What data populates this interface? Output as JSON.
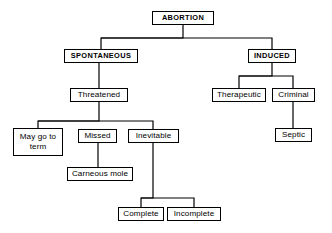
{
  "diagram": {
    "style": {
      "background": "#ffffff",
      "line_color": "#000000",
      "box_border": "#000000",
      "text_color": "#000000"
    },
    "nodes": [
      {
        "id": "abortion",
        "label": "ABORTION",
        "style": "caps",
        "x": 152,
        "y": 11,
        "w": 62,
        "h": 14
      },
      {
        "id": "spontaneous",
        "label": "SPONTANEOUS",
        "style": "caps",
        "x": 64,
        "y": 49,
        "w": 74,
        "h": 14
      },
      {
        "id": "induced",
        "label": "INDUCED",
        "style": "caps",
        "x": 248,
        "y": 49,
        "w": 48,
        "h": 14
      },
      {
        "id": "threatened",
        "label": "Threatened",
        "style": "plain",
        "x": 70,
        "y": 88,
        "w": 58,
        "h": 14
      },
      {
        "id": "therapeutic",
        "label": "Therapeutic",
        "style": "plain",
        "x": 212,
        "y": 88,
        "w": 54,
        "h": 14
      },
      {
        "id": "criminal",
        "label": "Criminal",
        "style": "plain",
        "x": 272,
        "y": 88,
        "w": 43,
        "h": 14
      },
      {
        "id": "may-go-term",
        "label": "May go to\nterm",
        "style": "multi",
        "x": 13,
        "y": 128,
        "w": 50,
        "h": 28
      },
      {
        "id": "missed",
        "label": "Missed",
        "style": "plain",
        "x": 78,
        "y": 129,
        "w": 39,
        "h": 14
      },
      {
        "id": "inevitable",
        "label": "Inevitable",
        "style": "plain",
        "x": 128,
        "y": 129,
        "w": 51,
        "h": 14
      },
      {
        "id": "septic",
        "label": "Septic",
        "style": "plain",
        "x": 275,
        "y": 128,
        "w": 37,
        "h": 14
      },
      {
        "id": "carneous",
        "label": "Carneous mole",
        "style": "plain",
        "x": 67,
        "y": 167,
        "w": 66,
        "h": 14
      },
      {
        "id": "complete",
        "label": "Complete",
        "style": "plain",
        "x": 118,
        "y": 207,
        "w": 46,
        "h": 14
      },
      {
        "id": "incomplete",
        "label": "Incomplete",
        "style": "plain",
        "x": 167,
        "y": 207,
        "w": 54,
        "h": 14
      }
    ],
    "edges": [
      {
        "id": "abortion-bus",
        "from": "abortion",
        "to": "spontaneous-induced-bus",
        "points": "183,25 183,38 101,38 101,49"
      },
      {
        "id": "abortion-to-induced",
        "from": "abortion",
        "to": "induced",
        "points": "101,38 272,38 272,49"
      },
      {
        "id": "spontaneous-threatened",
        "from": "spontaneous",
        "to": "threatened",
        "points": "99,63 99,88"
      },
      {
        "id": "induced-bus",
        "from": "induced",
        "to": "therapeutic",
        "points": "272,63 272,76 239,76 239,88"
      },
      {
        "id": "induced-to-criminal",
        "from": "induced",
        "to": "criminal",
        "points": "239,76 293,76 293,88"
      },
      {
        "id": "criminal-septic",
        "from": "criminal",
        "to": "septic",
        "points": "293,102 293,128"
      },
      {
        "id": "threatened-bus-left",
        "from": "threatened",
        "to": "may-go-term",
        "points": "99,102 99,121 38,121 38,128"
      },
      {
        "id": "threatened-to-missed",
        "from": "threatened",
        "to": "missed",
        "points": "38,121 153,121 153,129"
      },
      {
        "id": "missed-carneous",
        "from": "missed",
        "to": "carneous",
        "points": "98,143 98,167"
      },
      {
        "id": "inevitable-bus",
        "from": "inevitable",
        "to": "complete",
        "points": "153,143 153,198 141,198 141,207"
      },
      {
        "id": "inevitable-to-incomplete",
        "from": "inevitable",
        "to": "incomplete",
        "points": "141,198 194,198 194,207"
      }
    ]
  }
}
